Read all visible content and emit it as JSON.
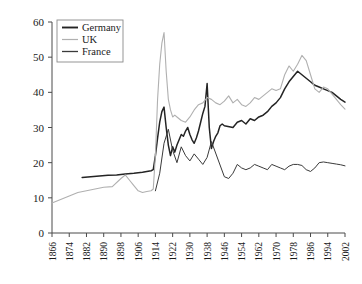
{
  "chart_data": {
    "type": "line",
    "title": "",
    "subtitle": "",
    "xlabel": "",
    "ylabel": "",
    "xlim": [
      1866,
      2002
    ],
    "ylim": [
      0,
      60
    ],
    "grid": false,
    "legend_position": "top-left",
    "xticks": [
      "1866",
      "1874",
      "1882",
      "1890",
      "1898",
      "1906",
      "1914",
      "1922",
      "1930",
      "1938",
      "1946",
      "1954",
      "1962",
      "1970",
      "1978",
      "1986",
      "1994",
      "2002"
    ],
    "yticks": [
      "0",
      "10",
      "20",
      "30",
      "40",
      "50",
      "60"
    ],
    "legend": [
      "Germany",
      "UK",
      "France"
    ],
    "colors": {
      "Germany": "#242424",
      "UK": "#b0b0b0",
      "France": "#3a3a3a",
      "axis": "#4a4a4a",
      "background": "#ffffff"
    },
    "series": [
      {
        "name": "Germany",
        "color": "#242424",
        "x": [
          1880,
          1884,
          1888,
          1892,
          1896,
          1900,
          1904,
          1908,
          1910,
          1912,
          1913,
          1914,
          1915,
          1916,
          1917,
          1918,
          1919,
          1920,
          1921,
          1922,
          1923,
          1924,
          1925,
          1926,
          1927,
          1928,
          1929,
          1930,
          1931,
          1932,
          1933,
          1934,
          1935,
          1936,
          1937,
          1938,
          1939,
          1940,
          1941,
          1942,
          1943,
          1944,
          1945,
          1946,
          1950,
          1952,
          1954,
          1956,
          1958,
          1960,
          1962,
          1964,
          1966,
          1968,
          1970,
          1972,
          1974,
          1976,
          1978,
          1980,
          1982,
          1984,
          1986,
          1988,
          1990,
          1992,
          1994,
          1996,
          1998,
          2000,
          2002
        ],
        "y": [
          15.8,
          16.0,
          16.2,
          16.4,
          16.5,
          16.8,
          17.0,
          17.3,
          17.5,
          17.7,
          18.0,
          22.0,
          27.0,
          31.5,
          34.5,
          35.8,
          30.0,
          25.0,
          22.0,
          24.5,
          23.0,
          25.0,
          26.5,
          28.0,
          27.5,
          29.0,
          30.0,
          28.0,
          26.5,
          25.5,
          27.0,
          29.0,
          31.5,
          34.0,
          36.0,
          42.5,
          30.0,
          24.0,
          26.0,
          27.5,
          28.5,
          30.5,
          31.0,
          30.5,
          30.0,
          31.5,
          32.0,
          31.0,
          32.5,
          32.0,
          33.0,
          33.5,
          34.5,
          36.0,
          37.0,
          38.5,
          41.0,
          43.0,
          44.5,
          46.0,
          45.0,
          44.0,
          43.0,
          42.0,
          41.5,
          41.0,
          40.5,
          40.0,
          39.0,
          38.0,
          37.2
        ]
      },
      {
        "name": "UK",
        "color": "#b0b0b0",
        "x": [
          1866,
          1870,
          1874,
          1878,
          1882,
          1886,
          1890,
          1894,
          1898,
          1900,
          1902,
          1904,
          1906,
          1908,
          1910,
          1912,
          1913,
          1914,
          1915,
          1916,
          1917,
          1918,
          1919,
          1920,
          1921,
          1922,
          1923,
          1924,
          1926,
          1928,
          1930,
          1932,
          1934,
          1936,
          1938,
          1940,
          1942,
          1944,
          1946,
          1948,
          1950,
          1952,
          1954,
          1956,
          1958,
          1960,
          1962,
          1964,
          1966,
          1968,
          1970,
          1972,
          1974,
          1976,
          1978,
          1980,
          1982,
          1984,
          1986,
          1988,
          1990,
          1992,
          1994,
          1996,
          1998,
          2000,
          2002
        ],
        "y": [
          8.5,
          9.5,
          10.5,
          11.5,
          12.0,
          12.5,
          13.0,
          13.2,
          15.5,
          16.5,
          15.0,
          13.5,
          12.0,
          11.5,
          11.8,
          12.0,
          12.5,
          22.0,
          38.0,
          48.0,
          54.0,
          57.0,
          46.0,
          38.0,
          35.0,
          33.0,
          33.5,
          33.0,
          32.0,
          31.5,
          33.0,
          35.0,
          36.5,
          37.0,
          38.5,
          38.0,
          37.0,
          36.5,
          37.5,
          39.0,
          37.0,
          38.0,
          36.5,
          36.0,
          37.0,
          38.5,
          38.0,
          39.0,
          40.0,
          41.0,
          40.5,
          41.0,
          45.0,
          47.5,
          46.0,
          48.0,
          50.5,
          49.0,
          45.0,
          41.0,
          40.0,
          41.5,
          41.0,
          39.5,
          38.0,
          36.5,
          35.2
        ]
      },
      {
        "name": "France",
        "color": "#3a3a3a",
        "x": [
          1914,
          1916,
          1918,
          1920,
          1922,
          1924,
          1926,
          1928,
          1930,
          1932,
          1934,
          1936,
          1938,
          1940,
          1946,
          1948,
          1950,
          1952,
          1954,
          1956,
          1958,
          1960,
          1962,
          1964,
          1966,
          1968,
          1970,
          1972,
          1974,
          1976,
          1978,
          1980,
          1982,
          1984,
          1986,
          1988,
          1990,
          1992,
          1994,
          1996,
          1998,
          2000,
          2002
        ],
        "y": [
          12.0,
          17.0,
          25.5,
          29.5,
          23.5,
          20.0,
          24.5,
          22.0,
          20.5,
          22.5,
          21.0,
          19.5,
          21.5,
          26.0,
          16.0,
          15.5,
          17.0,
          19.5,
          18.5,
          18.0,
          18.5,
          19.5,
          19.0,
          18.5,
          18.0,
          19.5,
          19.0,
          18.5,
          18.0,
          19.0,
          19.5,
          19.5,
          19.2,
          18.0,
          17.5,
          18.5,
          20.0,
          20.2,
          20.0,
          19.8,
          19.6,
          19.4,
          19.1
        ]
      }
    ]
  }
}
